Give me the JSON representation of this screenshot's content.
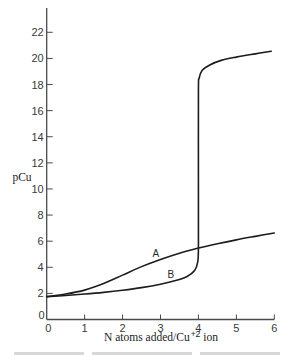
{
  "chart_data": {
    "type": "line",
    "title": "",
    "xlabel": "N atoms added/Cu+2 ion",
    "xlabel_parts": {
      "pre": "N atoms added/Cu",
      "sup": "+2",
      "post": " ion"
    },
    "ylabel": "pCu",
    "xlim": [
      0,
      6
    ],
    "ylim": [
      0,
      22
    ],
    "xticks": [
      0,
      1,
      2,
      3,
      4,
      5,
      6
    ],
    "yticks": [
      0,
      2,
      4,
      6,
      8,
      10,
      12,
      14,
      16,
      18,
      20,
      22
    ],
    "grid": false,
    "legend": null,
    "series": [
      {
        "name": "A",
        "x": [
          0,
          0.5,
          1,
          1.5,
          2,
          2.5,
          3,
          3.5,
          4,
          4.5,
          5,
          5.5,
          6
        ],
        "y": [
          1.75,
          1.95,
          2.25,
          2.75,
          3.4,
          4.05,
          4.6,
          5.08,
          5.47,
          5.8,
          6.1,
          6.37,
          6.63
        ]
      },
      {
        "name": "B",
        "x": [
          0,
          0.5,
          1,
          1.5,
          2,
          2.5,
          3,
          3.4,
          3.7,
          3.9,
          3.98,
          4.0,
          4.0,
          4.0,
          4.02,
          4.1,
          4.3,
          4.6,
          5.0,
          5.5,
          5.92
        ],
        "y": [
          1.75,
          1.84,
          1.95,
          2.08,
          2.24,
          2.44,
          2.7,
          2.98,
          3.3,
          3.75,
          4.4,
          5.5,
          10,
          17.5,
          18.5,
          19.1,
          19.5,
          19.85,
          20.1,
          20.35,
          20.55
        ]
      }
    ],
    "annotations": [
      {
        "text": "A",
        "x": 2.88,
        "y": 5.07
      },
      {
        "text": "B",
        "x": 3.27,
        "y": 3.46
      }
    ]
  },
  "colors": {
    "curve": "#1c1c1c",
    "axis": "#4a4a4a",
    "background": "#ffffff"
  }
}
